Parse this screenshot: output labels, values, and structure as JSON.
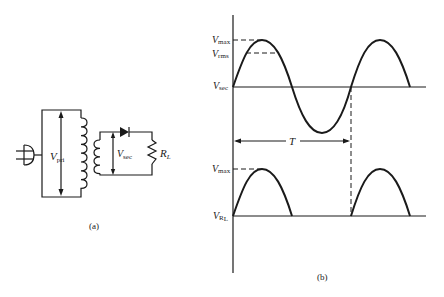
{
  "figure": {
    "part_a": {
      "caption": "(a)",
      "labels": {
        "v_pri": "V",
        "v_pri_sub": "pri",
        "v_sec": "V",
        "v_sec_sub": "sec",
        "r_load": "R",
        "r_load_sub": "L"
      },
      "components": [
        "ac-plug",
        "transformer-primary",
        "transformer-secondary",
        "diode",
        "load-resistor"
      ]
    },
    "part_b": {
      "caption": "(b)",
      "top_plot": {
        "v_max": "V",
        "v_max_sub": "max",
        "v_rms": "V",
        "v_rms_sub": "rms",
        "v_axis": "V",
        "v_axis_sub": "sec",
        "period_label": "T"
      },
      "bottom_plot": {
        "v_max": "V",
        "v_max_sub": "max",
        "v_axis": "V",
        "v_axis_sub": "R",
        "v_axis_subsub": "L"
      }
    }
  },
  "colors": {
    "ink": "#1a1a1a",
    "background": "#ffffff"
  }
}
